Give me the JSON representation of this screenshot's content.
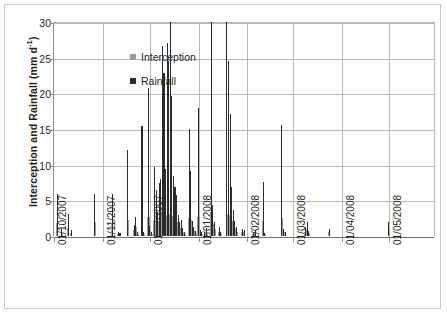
{
  "chart_data": {
    "type": "bar",
    "title": "",
    "xlabel": "",
    "ylabel_text": "Interception and Rainfall (mm d",
    "ylabel_sup": "-1",
    "ylabel_tail": ")",
    "ylabel_full": "Interception and Rainfall (mm d-1)",
    "ylim": [
      0,
      30
    ],
    "yticks": [
      0,
      5,
      10,
      15,
      20,
      25,
      30
    ],
    "grid": true,
    "legend_position": "top-left",
    "x_axis_type": "date",
    "x_tick_labels": [
      "01/10/2007",
      "01/11/2007",
      "01/12/2007",
      "01/01/2008",
      "01/02/2008",
      "01/03/2008",
      "01/04/2008",
      "01/05/2008"
    ],
    "x_range_days": [
      0,
      243
    ],
    "x_tick_days": [
      0,
      31,
      61,
      92,
      123,
      152,
      183,
      213
    ],
    "series": [
      {
        "name": "Rainfall",
        "color": "#2b2b2b",
        "points": [
          [
            2,
            5.9
          ],
          [
            5,
            1.0
          ],
          [
            9,
            3.1
          ],
          [
            11,
            0.8
          ],
          [
            26,
            5.9
          ],
          [
            37,
            5.9
          ],
          [
            41,
            0.6
          ],
          [
            42,
            0.4
          ],
          [
            47,
            12.0
          ],
          [
            51,
            1.6
          ],
          [
            52,
            2.6
          ],
          [
            53,
            0.5
          ],
          [
            56,
            15.4
          ],
          [
            57,
            0.5
          ],
          [
            60,
            20.7
          ],
          [
            61,
            1.4
          ],
          [
            62,
            0.6
          ],
          [
            64,
            9.7
          ],
          [
            65,
            6.4
          ],
          [
            66,
            3.3
          ],
          [
            67,
            7.5
          ],
          [
            68,
            8.0
          ],
          [
            69,
            26.7
          ],
          [
            70,
            22.8
          ],
          [
            71,
            9.4
          ],
          [
            72,
            27.1
          ],
          [
            73,
            24.6
          ],
          [
            74,
            30.0
          ],
          [
            75,
            19.6
          ],
          [
            76,
            8.4
          ],
          [
            77,
            6.9
          ],
          [
            78,
            5.7
          ],
          [
            79,
            3.0
          ],
          [
            80,
            1.9
          ],
          [
            81,
            2.2
          ],
          [
            82,
            1.1
          ],
          [
            83,
            0.6
          ],
          [
            86,
            15.0
          ],
          [
            87,
            9.1
          ],
          [
            88,
            2.1
          ],
          [
            89,
            1.3
          ],
          [
            90,
            0.7
          ],
          [
            92,
            18.0
          ],
          [
            93,
            0.8
          ],
          [
            94,
            0.5
          ],
          [
            96,
            0.5
          ],
          [
            97,
            1.1
          ],
          [
            100,
            30.0
          ],
          [
            101,
            4.4
          ],
          [
            102,
            2.0
          ],
          [
            105,
            1.2
          ],
          [
            106,
            0.6
          ],
          [
            110,
            30.0
          ],
          [
            111,
            24.6
          ],
          [
            112,
            17.1
          ],
          [
            113,
            6.9
          ],
          [
            114,
            3.6
          ],
          [
            115,
            2.1
          ],
          [
            116,
            1.2
          ],
          [
            120,
            1.0
          ],
          [
            121,
            0.9
          ],
          [
            127,
            0.6
          ],
          [
            128,
            0.8
          ],
          [
            133,
            7.6
          ],
          [
            134,
            0.4
          ],
          [
            145,
            15.5
          ],
          [
            146,
            1.0
          ],
          [
            147,
            0.6
          ],
          [
            160,
            1.2
          ],
          [
            161,
            2.0
          ],
          [
            162,
            0.7
          ],
          [
            175,
            1.0
          ],
          [
            213,
            1.9
          ]
        ]
      },
      {
        "name": "Interception",
        "color": "#9d9d9d",
        "points": [
          [
            2,
            1.8
          ],
          [
            5,
            0.5
          ],
          [
            9,
            1.1
          ],
          [
            11,
            0.4
          ],
          [
            26,
            1.9
          ],
          [
            37,
            1.8
          ],
          [
            41,
            0.3
          ],
          [
            42,
            0.2
          ],
          [
            47,
            2.2
          ],
          [
            51,
            0.8
          ],
          [
            52,
            1.2
          ],
          [
            53,
            0.3
          ],
          [
            56,
            2.4
          ],
          [
            57,
            0.3
          ],
          [
            60,
            2.6
          ],
          [
            61,
            0.7
          ],
          [
            62,
            0.3
          ],
          [
            64,
            2.3
          ],
          [
            65,
            2.0
          ],
          [
            66,
            1.5
          ],
          [
            67,
            2.1
          ],
          [
            68,
            2.2
          ],
          [
            69,
            3.0
          ],
          [
            70,
            2.9
          ],
          [
            71,
            2.3
          ],
          [
            72,
            3.0
          ],
          [
            73,
            2.9
          ],
          [
            74,
            3.1
          ],
          [
            75,
            2.8
          ],
          [
            76,
            2.2
          ],
          [
            77,
            2.0
          ],
          [
            78,
            1.9
          ],
          [
            79,
            1.4
          ],
          [
            80,
            1.0
          ],
          [
            81,
            1.1
          ],
          [
            82,
            0.6
          ],
          [
            83,
            0.3
          ],
          [
            86,
            2.5
          ],
          [
            87,
            2.2
          ],
          [
            88,
            1.1
          ],
          [
            89,
            0.7
          ],
          [
            90,
            0.4
          ],
          [
            92,
            2.6
          ],
          [
            93,
            0.4
          ],
          [
            94,
            0.3
          ],
          [
            96,
            0.3
          ],
          [
            97,
            0.6
          ],
          [
            100,
            3.1
          ],
          [
            101,
            1.7
          ],
          [
            102,
            1.0
          ],
          [
            105,
            0.6
          ],
          [
            106,
            0.3
          ],
          [
            110,
            3.1
          ],
          [
            111,
            2.9
          ],
          [
            112,
            2.6
          ],
          [
            113,
            2.1
          ],
          [
            114,
            1.6
          ],
          [
            115,
            1.1
          ],
          [
            116,
            0.6
          ],
          [
            120,
            0.5
          ],
          [
            121,
            0.5
          ],
          [
            127,
            0.3
          ],
          [
            128,
            0.4
          ],
          [
            133,
            2.1
          ],
          [
            134,
            0.2
          ],
          [
            145,
            2.5
          ],
          [
            146,
            0.5
          ],
          [
            147,
            0.3
          ],
          [
            160,
            0.6
          ],
          [
            161,
            1.0
          ],
          [
            162,
            0.4
          ],
          [
            175,
            0.5
          ],
          [
            213,
            0.9
          ]
        ]
      }
    ],
    "legend": [
      {
        "label": "Interception",
        "color": "#9d9d9d",
        "marker": "square"
      },
      {
        "label": "Rainfall",
        "color": "#2b2b2b",
        "marker": "square"
      }
    ]
  }
}
